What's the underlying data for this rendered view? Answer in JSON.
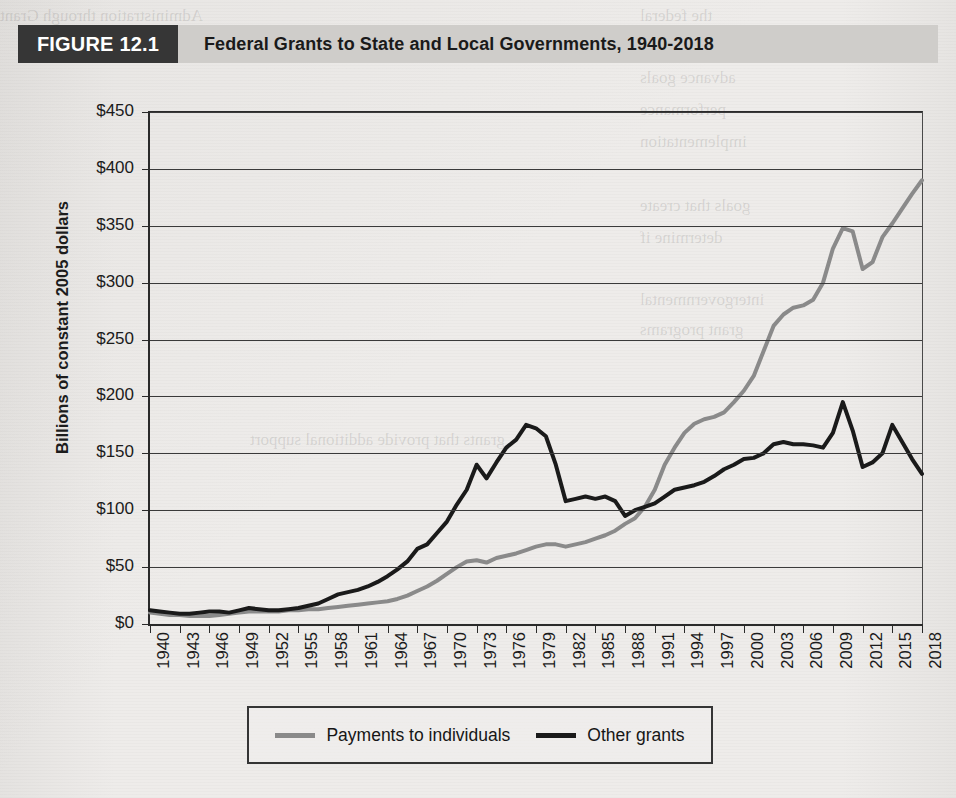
{
  "figure": {
    "tag": "FIGURE 12.1",
    "title": "Federal Grants to State and Local Governments, 1940-2018"
  },
  "legend": {
    "entries": [
      {
        "label": "Payments to individuals",
        "color": "#8a8a8a"
      },
      {
        "label": "Other grants",
        "color": "#1a1a1a"
      }
    ]
  },
  "chart_data": {
    "type": "line",
    "title": "Federal Grants to State and Local Governments, 1940-2018",
    "xlabel": "",
    "ylabel": "Billions of constant 2005 dollars",
    "xlim": [
      1940,
      2018
    ],
    "ylim": [
      0,
      450
    ],
    "ytick_labels": [
      "$450",
      "$400",
      "$350",
      "$300",
      "$250",
      "$200",
      "$150",
      "$100",
      "$50",
      "$0"
    ],
    "ytick_values": [
      450,
      400,
      350,
      300,
      250,
      200,
      150,
      100,
      50,
      0
    ],
    "xtick_labels": [
      "1940",
      "1943",
      "1946",
      "1949",
      "1952",
      "1955",
      "1958",
      "1961",
      "1964",
      "1967",
      "1970",
      "1973",
      "1976",
      "1979",
      "1982",
      "1985",
      "1988",
      "1991",
      "1994",
      "1997",
      "2000",
      "2003",
      "2006",
      "2009",
      "2012",
      "2015",
      "2018"
    ],
    "xtick_values": [
      1940,
      1943,
      1946,
      1949,
      1952,
      1955,
      1958,
      1961,
      1964,
      1967,
      1970,
      1973,
      1976,
      1979,
      1982,
      1985,
      1988,
      1991,
      1994,
      1997,
      2000,
      2003,
      2006,
      2009,
      2012,
      2015,
      2018
    ],
    "grid": true,
    "legend_position": "bottom",
    "x": [
      1940,
      1941,
      1942,
      1943,
      1944,
      1945,
      1946,
      1947,
      1948,
      1949,
      1950,
      1951,
      1952,
      1953,
      1954,
      1955,
      1956,
      1957,
      1958,
      1959,
      1960,
      1961,
      1962,
      1963,
      1964,
      1965,
      1966,
      1967,
      1968,
      1969,
      1970,
      1971,
      1972,
      1973,
      1974,
      1975,
      1976,
      1977,
      1978,
      1979,
      1980,
      1981,
      1982,
      1983,
      1984,
      1985,
      1986,
      1987,
      1988,
      1989,
      1990,
      1991,
      1992,
      1993,
      1994,
      1995,
      1996,
      1997,
      1998,
      1999,
      2000,
      2001,
      2002,
      2003,
      2004,
      2005,
      2006,
      2007,
      2008,
      2009,
      2010,
      2011,
      2012,
      2013,
      2014,
      2015,
      2016,
      2017,
      2018
    ],
    "series": [
      {
        "name": "Payments to individuals",
        "color": "#8a8a8a",
        "values": [
          10,
          9,
          8,
          8,
          7,
          7,
          7,
          8,
          9,
          10,
          11,
          11,
          11,
          11,
          12,
          12,
          13,
          13,
          14,
          15,
          16,
          17,
          18,
          19,
          20,
          22,
          25,
          29,
          33,
          38,
          44,
          50,
          55,
          56,
          54,
          58,
          60,
          62,
          65,
          68,
          70,
          70,
          68,
          70,
          72,
          75,
          78,
          82,
          88,
          93,
          103,
          118,
          140,
          155,
          168,
          176,
          180,
          182,
          186,
          195,
          205,
          218,
          240,
          262,
          272,
          278,
          280,
          285,
          300,
          330,
          348,
          345,
          312,
          318,
          340,
          352,
          365,
          378,
          390
        ]
      },
      {
        "name": "Other grants",
        "color": "#1a1a1a",
        "values": [
          12,
          11,
          10,
          9,
          9,
          10,
          11,
          11,
          10,
          12,
          14,
          13,
          12,
          12,
          13,
          14,
          16,
          18,
          22,
          26,
          28,
          30,
          33,
          37,
          42,
          48,
          55,
          66,
          70,
          80,
          90,
          105,
          118,
          140,
          128,
          142,
          155,
          162,
          175,
          172,
          165,
          140,
          108,
          110,
          112,
          110,
          112,
          108,
          95,
          100,
          103,
          106,
          112,
          118,
          120,
          122,
          125,
          130,
          136,
          140,
          145,
          146,
          150,
          158,
          160,
          158,
          158,
          157,
          155,
          168,
          195,
          170,
          138,
          142,
          150,
          175,
          160,
          145,
          132
        ]
      }
    ]
  }
}
